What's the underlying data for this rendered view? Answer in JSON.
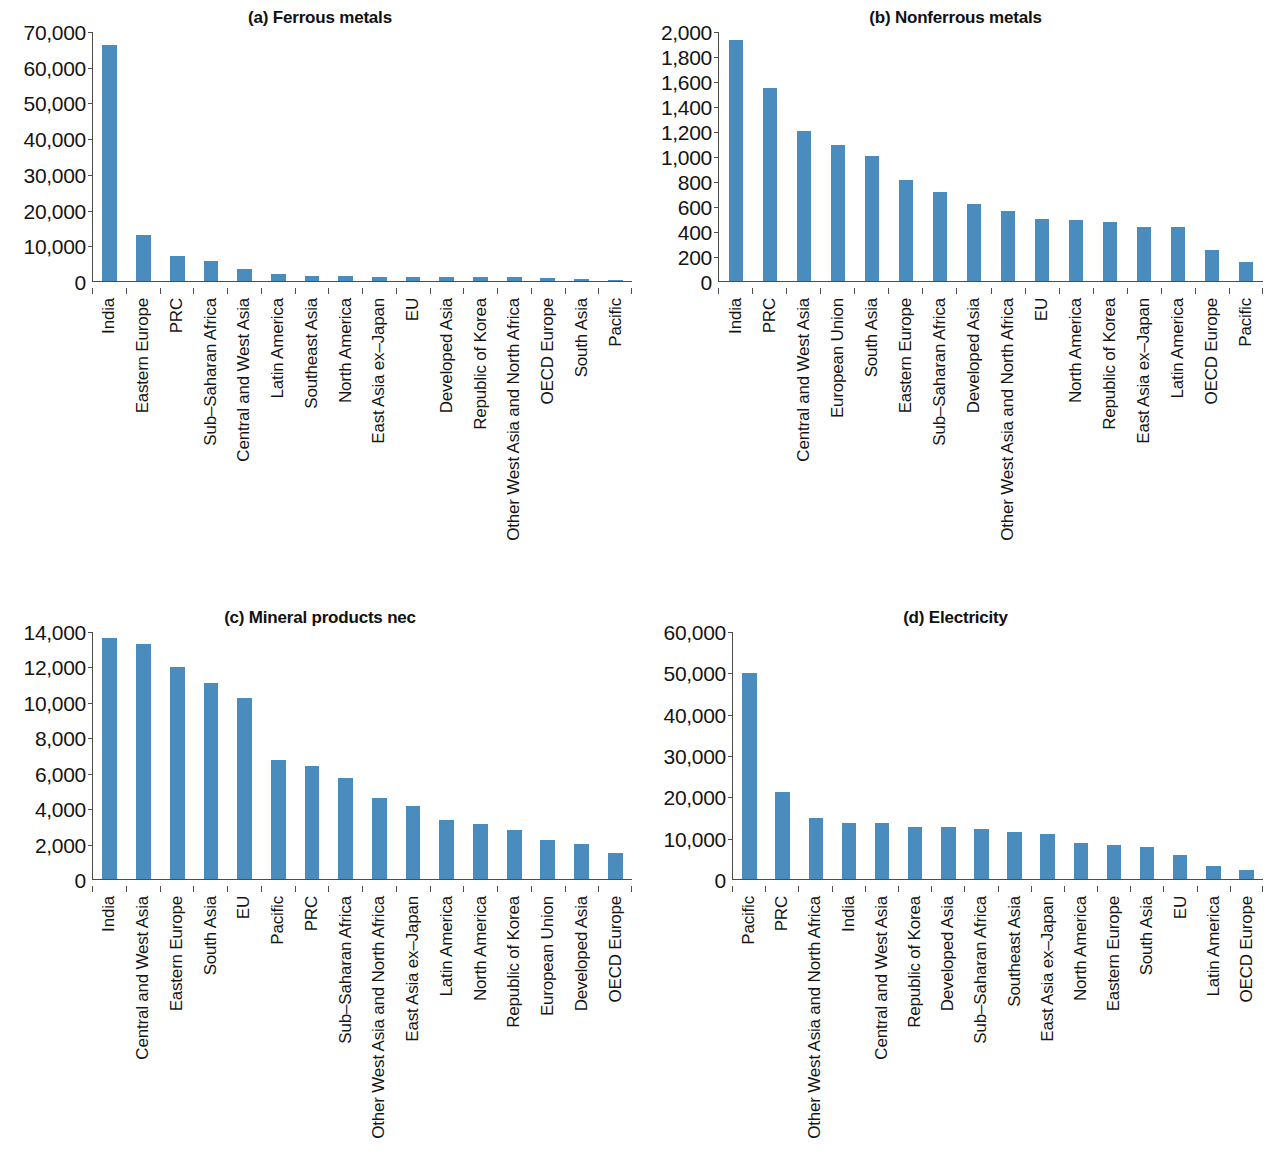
{
  "figure": {
    "colors": {
      "bar": "#4a8cbe",
      "axis": "#4d4d4d",
      "text": "#141414"
    }
  },
  "chart_data": [
    {
      "type": "bar",
      "title": "(a) Ferrous metals",
      "panel_id": "a",
      "xlabel": "",
      "ylabel": "",
      "ylim": [
        0,
        70000
      ],
      "ytick_values": [
        0,
        10000,
        20000,
        30000,
        40000,
        50000,
        60000,
        70000
      ],
      "ytick_labels": [
        "0",
        "10,000",
        "20,000",
        "30,000",
        "40,000",
        "50,000",
        "60,000",
        "70,000"
      ],
      "grid": false,
      "legend": "none",
      "categories": [
        "India",
        "Eastern Europe",
        "PRC",
        "Sub–Saharan Africa",
        "Central and West Asia",
        "Latin America",
        "Southeast Asia",
        "North America",
        "East Asia ex–Japan",
        "EU",
        "Developed Asia",
        "Republic of Korea",
        "Other West Asia and North Africa",
        "OECD Europe",
        "South Asia",
        "Pacific"
      ],
      "values": [
        66000,
        12800,
        7000,
        5500,
        3300,
        2000,
        1500,
        1400,
        1200,
        1200,
        1100,
        1100,
        1000,
        900,
        500,
        120
      ]
    },
    {
      "type": "bar",
      "title": "(b) Nonferrous metals",
      "panel_id": "b",
      "xlabel": "",
      "ylabel": "",
      "ylim": [
        0,
        2000
      ],
      "ytick_values": [
        0,
        200,
        400,
        600,
        800,
        1000,
        1200,
        1400,
        1600,
        1800,
        2000
      ],
      "ytick_labels": [
        "0",
        "200",
        "400",
        "600",
        "800",
        "1,000",
        "1,200",
        "1,400",
        "1,600",
        "1,800",
        "2,000"
      ],
      "grid": false,
      "legend": "none",
      "categories": [
        "India",
        "PRC",
        "Central and West Asia",
        "European Union",
        "South Asia",
        "Eastern Europe",
        "Sub–Saharan Africa",
        "Developed Asia",
        "Other West Asia and North Africa",
        "EU",
        "North America",
        "Republic of Korea",
        "East Asia ex–Japan",
        "Latin America",
        "OECD Europe",
        "Pacific"
      ],
      "values": [
        1930,
        1545,
        1200,
        1085,
        1000,
        810,
        710,
        620,
        560,
        495,
        485,
        470,
        435,
        430,
        250,
        155
      ]
    },
    {
      "type": "bar",
      "title": "(c) Mineral products nec",
      "panel_id": "c",
      "xlabel": "",
      "ylabel": "",
      "ylim": [
        0,
        14000
      ],
      "ytick_values": [
        0,
        2000,
        4000,
        6000,
        8000,
        10000,
        12000,
        14000
      ],
      "ytick_labels": [
        "0",
        "2,000",
        "4,000",
        "6,000",
        "8,000",
        "10,000",
        "12,000",
        "14,000"
      ],
      "grid": false,
      "legend": "none",
      "categories": [
        "India",
        "Central and West Asia",
        "Eastern Europe",
        "South Asia",
        "EU",
        "Pacific",
        "PRC",
        "Sub–Saharan Africa",
        "Other West Asia and North Africa",
        "East Asia ex–Japan",
        "Latin America",
        "North America",
        "Republic of Korea",
        "European Union",
        "Developed Asia",
        "OECD Europe"
      ],
      "values": [
        13600,
        13250,
        11950,
        11050,
        10200,
        6700,
        6400,
        5700,
        4550,
        4150,
        3350,
        3100,
        2750,
        2200,
        2000,
        1450
      ]
    },
    {
      "type": "bar",
      "title": "(d) Electricity",
      "panel_id": "d",
      "xlabel": "",
      "ylabel": "",
      "ylim": [
        0,
        60000
      ],
      "ytick_values": [
        0,
        10000,
        20000,
        30000,
        40000,
        50000,
        60000
      ],
      "ytick_labels": [
        "0",
        "10,000",
        "20,000",
        "30,000",
        "40,000",
        "50,000",
        "60,000"
      ],
      "grid": false,
      "legend": "none",
      "categories": [
        "Pacific",
        "PRC",
        "Other West Asia and North Africa",
        "India",
        "Central and West Asia",
        "Republic of Korea",
        "Developed Asia",
        "Sub–Saharan Africa",
        "Southeast Asia",
        "East Asia ex–Japan",
        "North America",
        "Eastern Europe",
        "South Asia",
        "EU",
        "Latin America",
        "OECD Europe"
      ],
      "values": [
        49800,
        21000,
        14700,
        13500,
        13500,
        12700,
        12500,
        12000,
        11400,
        11000,
        8700,
        8300,
        7800,
        5900,
        3200,
        2100
      ]
    }
  ]
}
